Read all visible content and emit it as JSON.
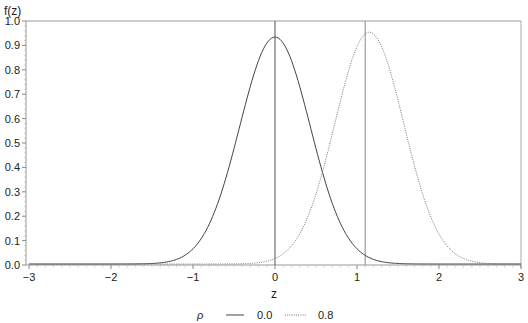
{
  "chart_data": {
    "type": "line",
    "title": "",
    "xlabel": "z",
    "ylabel": "f(z)",
    "xlim": [
      -3,
      3
    ],
    "ylim": [
      0.0,
      1.0
    ],
    "xticks": [
      -3,
      -2,
      -1,
      0,
      1,
      2,
      3
    ],
    "xtick_labels": [
      "−3",
      "−2",
      "−1",
      "0",
      "1",
      "2",
      "3"
    ],
    "yticks": [
      0.0,
      0.1,
      0.2,
      0.3,
      0.4,
      0.5,
      0.6,
      0.7,
      0.8,
      0.9,
      1.0
    ],
    "ytick_labels": [
      "0.0",
      "0.1",
      "0.2",
      "0.3",
      "0.4",
      "0.5",
      "0.6",
      "0.7",
      "0.8",
      "0.9",
      "1.0"
    ],
    "grid": false,
    "legend": {
      "title": "ρ",
      "position": "bottom",
      "entries": [
        "0.0",
        "0.8"
      ]
    },
    "reference_lines": [
      {
        "axis": "x",
        "value": 0.0,
        "style": "solid"
      },
      {
        "axis": "x",
        "value": 1.1,
        "style": "solid-light"
      }
    ],
    "series": [
      {
        "name": "0.0",
        "style": "solid",
        "color": "#444444",
        "mean": 0.0,
        "sd": 0.43,
        "peak": 0.93,
        "x": [
          -3,
          -2,
          -1.5,
          -1.2,
          -1,
          -0.8,
          -0.6,
          -0.4,
          -0.2,
          0,
          0.2,
          0.4,
          0.6,
          0.8,
          1,
          1.2,
          1.5,
          2,
          3
        ],
        "values": [
          0.0,
          0.0,
          0.002,
          0.02,
          0.06,
          0.16,
          0.35,
          0.6,
          0.84,
          0.93,
          0.84,
          0.6,
          0.35,
          0.16,
          0.06,
          0.02,
          0.002,
          0.0,
          0.0
        ]
      },
      {
        "name": "0.8",
        "style": "dotted",
        "color": "#777777",
        "mean": 1.15,
        "sd": 0.42,
        "peak": 0.95,
        "x": [
          -3,
          -1,
          -0.5,
          0,
          0.3,
          0.5,
          0.7,
          0.9,
          1.15,
          1.4,
          1.6,
          1.8,
          2.0,
          2.3,
          2.6,
          3
        ],
        "values": [
          0.0,
          0.0,
          0.003,
          0.02,
          0.12,
          0.29,
          0.54,
          0.8,
          0.95,
          0.8,
          0.54,
          0.29,
          0.12,
          0.02,
          0.003,
          0.0
        ]
      }
    ]
  }
}
